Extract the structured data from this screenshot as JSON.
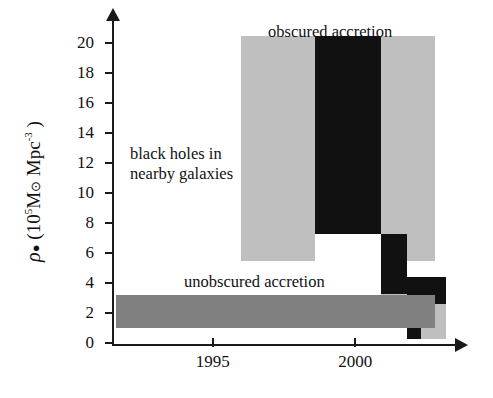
{
  "chart_data": {
    "type": "bar",
    "title": "",
    "xlabel": "",
    "ylabel": "ρ• (10⁵ M⊙ Mpc⁻³)",
    "xlim": [
      1991.5,
      2003.5
    ],
    "ylim": [
      0,
      21.5
    ],
    "grid": false,
    "legend_position": "none",
    "x_ticks": [
      {
        "label": "1995",
        "value": 1995
      },
      {
        "label": "2000",
        "value": 2000
      }
    ],
    "y_ticks": [
      {
        "label": "20",
        "value": 20
      },
      {
        "label": "18",
        "value": 18
      },
      {
        "label": "16",
        "value": 16
      },
      {
        "label": "14",
        "value": 14
      },
      {
        "label": "12",
        "value": 12
      },
      {
        "label": "10",
        "value": 10
      },
      {
        "label": "8",
        "value": 8
      },
      {
        "label": "6",
        "value": 6
      },
      {
        "label": "4",
        "value": 4
      },
      {
        "label": "2",
        "value": 2
      },
      {
        "label": "0",
        "value": 0
      }
    ],
    "annotations": [
      {
        "name": "obscured-accretion",
        "text": "obscured accretion",
        "x": 1997.6,
        "y": 21.2
      },
      {
        "name": "unobscured-accretion",
        "text": "unobscured accretion",
        "x": 1995.4,
        "y": 4.8
      },
      {
        "name": "black-holes-nearby-galaxies",
        "text": "black holes in\nnearby galaxies",
        "x": 1993.3,
        "y": 12.6
      }
    ],
    "series": [
      {
        "name": "obscured accretion (upper limit range)",
        "color": "#bfbfbf",
        "blocks": [
          {
            "name": "obscured-gray-left",
            "x0": 1996.0,
            "x1": 1998.6,
            "y0": 5.5,
            "y1": 20.5
          },
          {
            "name": "obscured-gray-right",
            "x0": 2000.9,
            "x1": 2002.8,
            "y0": 5.5,
            "y1": 20.5
          },
          {
            "name": "obscured-gray-step-low-left",
            "x0": 2000.9,
            "x1": 2001.8,
            "y0": 1.0,
            "y1": 3.3
          },
          {
            "name": "obscured-gray-step-low-right",
            "x0": 2002.3,
            "x1": 2003.2,
            "y0": 0.3,
            "y1": 3.3
          }
        ]
      },
      {
        "name": "obscured accretion (best estimate)",
        "color": "#111111",
        "blocks": [
          {
            "name": "obscured-black-main",
            "x0": 1998.6,
            "x1": 2000.9,
            "y0": 7.3,
            "y1": 20.5
          },
          {
            "name": "obscured-black-step-1",
            "x0": 2000.9,
            "x1": 2001.8,
            "y0": 3.3,
            "y1": 7.3
          },
          {
            "name": "obscured-black-step-2",
            "x0": 2001.8,
            "x1": 2003.2,
            "y0": 2.6,
            "y1": 4.4
          },
          {
            "name": "obscured-black-step-3",
            "x0": 2001.8,
            "x1": 2002.3,
            "y0": 0.3,
            "y1": 2.6
          }
        ]
      },
      {
        "name": "unobscured accretion",
        "color": "#808080",
        "blocks": [
          {
            "name": "unobscured-bar",
            "x0": 1991.6,
            "x1": 2002.8,
            "y0": 1.0,
            "y1": 3.2
          }
        ]
      }
    ]
  },
  "axis": {
    "y_title_prefix": "ρ",
    "y_title_bullet": "●",
    "y_title_body": " (10",
    "y_title_exp": "5",
    "y_title_mass": "M",
    "y_title_sun": "⊙",
    "y_title_mpc": " Mpc",
    "y_title_mpc_exp": "-3",
    "y_title_close": " )"
  }
}
